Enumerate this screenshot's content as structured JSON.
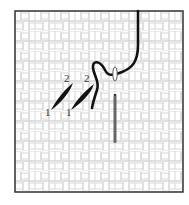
{
  "diagram": {
    "canvas": {
      "border_color": "#333333",
      "grid_color": "#d0d0d0",
      "background": "#ffffff"
    },
    "stitches": [
      {
        "start_label": "1",
        "end_label": "2"
      },
      {
        "start_label": "1",
        "end_label": "2"
      }
    ],
    "thread_color": "#111111",
    "needle_color": "#666666"
  }
}
